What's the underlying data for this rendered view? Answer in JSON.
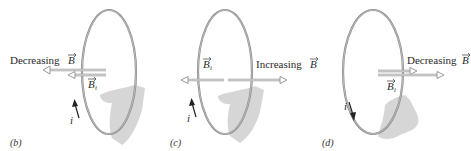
{
  "figure": {
    "panels": [
      {
        "id": "b",
        "label": "(b)",
        "field_label": "Decreasing",
        "field_symbol": "B",
        "induced_symbol": "B",
        "induced_subscript": "i",
        "current_symbol": "i",
        "field_direction": "left",
        "induced_direction": "left",
        "current_direction": "up"
      },
      {
        "id": "c",
        "label": "(c)",
        "field_label": "Increasing",
        "field_symbol": "B",
        "induced_symbol": "B",
        "induced_subscript": "i",
        "current_symbol": "i",
        "field_direction": "right",
        "induced_direction": "left",
        "current_direction": "up"
      },
      {
        "id": "d",
        "label": "(d)",
        "field_label": "Decreasing",
        "field_symbol": "B",
        "induced_symbol": "B",
        "induced_subscript": "i",
        "current_symbol": "i",
        "field_direction": "right",
        "induced_direction": "right",
        "current_direction": "down"
      }
    ],
    "colors": {
      "loop": "#8a8a8a",
      "arrow": "#9a9a9a",
      "hand": "#c8c8c8",
      "text": "#2b2b2b"
    }
  }
}
